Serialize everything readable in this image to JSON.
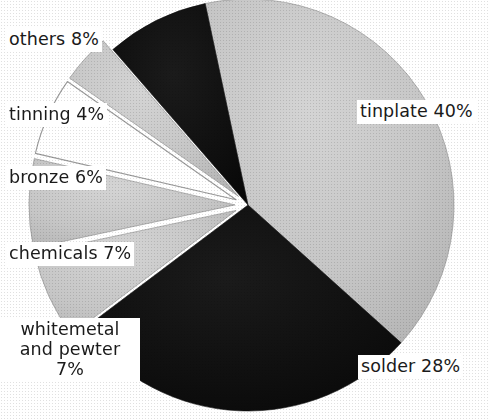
{
  "figure": {
    "kind": "pie-chart",
    "background_color": "#ffffff",
    "text_color": "#1a1a1a"
  },
  "chart_data": {
    "type": "pie",
    "title": "",
    "subtitle": "",
    "xlabel": "",
    "ylabel": "",
    "legend_position": "none",
    "grid": false,
    "labels_on_slices": true,
    "value_unit": "%",
    "total": 100,
    "categories": [
      "tinplate",
      "solder",
      "whitemetal and pewter",
      "chemicals",
      "bronze",
      "tinning",
      "others"
    ],
    "values": [
      40,
      28,
      7,
      7,
      6,
      4,
      8
    ],
    "slices": [
      {
        "name": "tinplate",
        "label": "tinplate 40%",
        "value": 40,
        "fill": "#c9c9c9",
        "fill_name": "light-gray",
        "stroke": "#8a8a8a",
        "exploded": false,
        "start_angle": -12,
        "end_angle": 132
      },
      {
        "name": "solder",
        "label": "solder 28%",
        "value": 28,
        "fill": "#111111",
        "fill_name": "black",
        "stroke": "#111111",
        "exploded": false,
        "start_angle": 132,
        "end_angle": 233
      },
      {
        "name": "whitemetal and pewter",
        "label": "whitemetal\nand pewter\n7%",
        "label_line_1": "whitemetal",
        "label_line_2": "and pewter",
        "label_line_3": "7%",
        "value": 7,
        "fill": "#c9c9c9",
        "fill_name": "light-gray",
        "stroke": "#8a8a8a",
        "exploded": true,
        "start_angle": 233,
        "end_angle": 258
      },
      {
        "name": "chemicals",
        "label": "chemicals 7%",
        "value": 7,
        "fill": "#c9c9c9",
        "fill_name": "light-gray",
        "stroke": "#8a8a8a",
        "exploded": true,
        "start_angle": 258,
        "end_angle": 283
      },
      {
        "name": "bronze",
        "label": "bronze 6%",
        "value": 6,
        "fill": "#ffffff",
        "fill_name": "white",
        "stroke": "#9a9a9a",
        "exploded": true,
        "start_angle": 283,
        "end_angle": 305
      },
      {
        "name": "tinning",
        "label": "tinning 4%",
        "value": 4,
        "fill": "#c9c9c9",
        "fill_name": "light-gray",
        "stroke": "#8a8a8a",
        "exploded": true,
        "start_angle": 305,
        "end_angle": 319
      },
      {
        "name": "others",
        "label": "others 8%",
        "value": 8,
        "fill": "#111111",
        "fill_name": "black",
        "stroke": "#111111",
        "exploded": false,
        "start_angle": 319,
        "end_angle": 348
      }
    ]
  }
}
